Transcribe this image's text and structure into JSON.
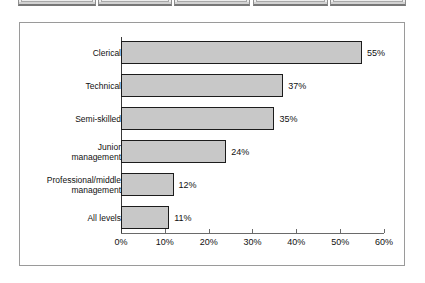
{
  "toolbar": {
    "boxes": [
      {
        "name": "toolbar-box-1",
        "left": 18,
        "width": 78
      },
      {
        "name": "toolbar-box-2",
        "left": 98,
        "width": 74
      },
      {
        "name": "toolbar-box-3",
        "left": 174,
        "width": 76
      },
      {
        "name": "toolbar-box-4",
        "left": 253,
        "width": 75
      },
      {
        "name": "toolbar-box-5",
        "left": 330,
        "width": 76
      }
    ]
  },
  "chart_data": {
    "type": "bar",
    "orientation": "horizontal",
    "title": "",
    "subtitle": "",
    "xlabel": "",
    "ylabel": "",
    "categories": [
      "Clerical",
      "Technical",
      "Semi-skilled",
      "Junior\nmanagement",
      "Professional/middle\nmanagement",
      "All levels"
    ],
    "values": [
      55,
      37,
      35,
      24,
      12,
      11
    ],
    "data_labels": [
      "55%",
      "37%",
      "35%",
      "24%",
      "12%",
      "11%"
    ],
    "xlim": [
      0,
      60
    ],
    "xticks": [
      0,
      10,
      20,
      30,
      40,
      50,
      60
    ],
    "xtick_labels": [
      "0%",
      "10%",
      "20%",
      "30%",
      "40%",
      "50%",
      "60%"
    ],
    "grid": false,
    "legend": "none",
    "bar_fill_color": "#c8c8c8",
    "bar_border_color": "#1c1c1c",
    "axis_color": "#6a6a6a",
    "panel_border_color": "#9a9a9a",
    "background_color": "#ffffff"
  },
  "geometry": {
    "axis_x0": 101,
    "px_per_unit": 4.383,
    "bar_tops": [
      18,
      51,
      84,
      117,
      150,
      183
    ],
    "bar_height": 23,
    "axis_top": 14,
    "axis_bottom": 210,
    "tick_label_y": 214
  }
}
